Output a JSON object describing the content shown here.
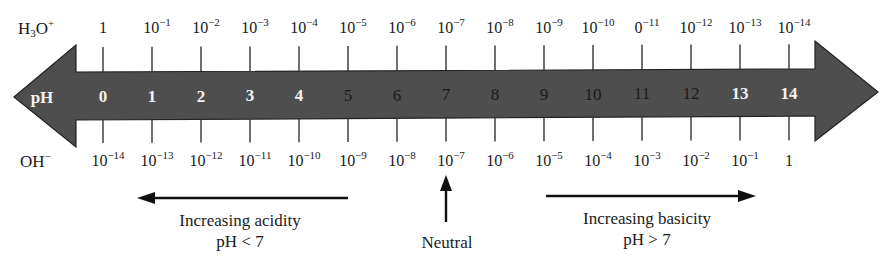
{
  "diagram": {
    "title_row_top": {
      "label_main": "H",
      "label_sub": "3",
      "label_after": "O",
      "label_sup": "+",
      "values": [
        {
          "base": "1",
          "exp": ""
        },
        {
          "base": "10",
          "exp": "−1"
        },
        {
          "base": "10",
          "exp": "−2"
        },
        {
          "base": "10",
          "exp": "−3"
        },
        {
          "base": "10",
          "exp": "−4"
        },
        {
          "base": "10",
          "exp": "−5"
        },
        {
          "base": "10",
          "exp": "−6"
        },
        {
          "base": "10",
          "exp": "−7"
        },
        {
          "base": "10",
          "exp": "−8"
        },
        {
          "base": "10",
          "exp": "−9"
        },
        {
          "base": "10",
          "exp": "−10"
        },
        {
          "base": "0",
          "exp": "−11"
        },
        {
          "base": "10",
          "exp": "−12"
        },
        {
          "base": "10",
          "exp": "−13"
        },
        {
          "base": "10",
          "exp": "−14"
        }
      ]
    },
    "scale": {
      "label": "pH",
      "values": [
        "0",
        "1",
        "2",
        "3",
        "4",
        "5",
        "6",
        "7",
        "8",
        "9",
        "10",
        "11",
        "12",
        "13",
        "14"
      ],
      "gradient_colors": {
        "end": "#4a4a4a",
        "mid": "#ffffff"
      }
    },
    "title_row_bottom": {
      "label_main": "OH",
      "label_sup": "−",
      "values": [
        {
          "base": "10",
          "exp": "−14"
        },
        {
          "base": "10",
          "exp": "−13"
        },
        {
          "base": "10",
          "exp": "−12"
        },
        {
          "base": "10",
          "exp": "−11"
        },
        {
          "base": "10",
          "exp": "−10"
        },
        {
          "base": "10",
          "exp": "−9"
        },
        {
          "base": "10",
          "exp": "−8"
        },
        {
          "base": "10",
          "exp": "−7"
        },
        {
          "base": "10",
          "exp": "−6"
        },
        {
          "base": "10",
          "exp": "−5"
        },
        {
          "base": "10",
          "exp": "−4"
        },
        {
          "base": "10",
          "exp": "−3"
        },
        {
          "base": "10",
          "exp": "−2"
        },
        {
          "base": "10",
          "exp": "−1"
        },
        {
          "base": "1",
          "exp": ""
        }
      ]
    },
    "annotations": {
      "acidity": {
        "line1": "Increasing acidity",
        "line2": "pH < 7",
        "arrow": "left-arrow-icon"
      },
      "neutral": {
        "label": "Neutral",
        "arrow": "up-arrow-icon"
      },
      "basicity": {
        "line1": "Increasing basicity",
        "line2": "pH > 7",
        "arrow": "right-arrow-icon"
      }
    }
  }
}
